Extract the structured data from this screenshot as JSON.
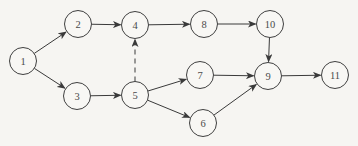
{
  "diagram": {
    "type": "directed-graph",
    "background_color": "#f6f5f2",
    "node_stroke_color": "#3f3f3f",
    "node_fill_color": "#f8f7f4",
    "edge_color": "#3a3a3a",
    "label_color": "#4a4a4a",
    "node_radius": 13.5,
    "nodes": [
      {
        "id": "1",
        "label": "1",
        "x": 23,
        "y": 61
      },
      {
        "id": "2",
        "label": "2",
        "x": 78,
        "y": 24
      },
      {
        "id": "3",
        "label": "3",
        "x": 77,
        "y": 96
      },
      {
        "id": "4",
        "label": "4",
        "x": 135,
        "y": 25
      },
      {
        "id": "5",
        "label": "5",
        "x": 135,
        "y": 95
      },
      {
        "id": "6",
        "label": "6",
        "x": 203,
        "y": 123
      },
      {
        "id": "7",
        "label": "7",
        "x": 200,
        "y": 75
      },
      {
        "id": "8",
        "label": "8",
        "x": 204,
        "y": 24
      },
      {
        "id": "9",
        "label": "9",
        "x": 268,
        "y": 76
      },
      {
        "id": "10",
        "label": "10",
        "x": 270,
        "y": 24
      },
      {
        "id": "11",
        "label": "11",
        "x": 335,
        "y": 75
      }
    ],
    "edges": [
      {
        "from": "1",
        "to": "2",
        "style": "solid"
      },
      {
        "from": "1",
        "to": "3",
        "style": "solid"
      },
      {
        "from": "2",
        "to": "4",
        "style": "solid"
      },
      {
        "from": "3",
        "to": "5",
        "style": "solid"
      },
      {
        "from": "5",
        "to": "4",
        "style": "dashed"
      },
      {
        "from": "4",
        "to": "8",
        "style": "solid"
      },
      {
        "from": "8",
        "to": "10",
        "style": "solid"
      },
      {
        "from": "5",
        "to": "7",
        "style": "solid"
      },
      {
        "from": "5",
        "to": "6",
        "style": "solid"
      },
      {
        "from": "7",
        "to": "9",
        "style": "solid"
      },
      {
        "from": "6",
        "to": "9",
        "style": "solid"
      },
      {
        "from": "10",
        "to": "9",
        "style": "solid"
      },
      {
        "from": "9",
        "to": "11",
        "style": "solid"
      }
    ]
  }
}
